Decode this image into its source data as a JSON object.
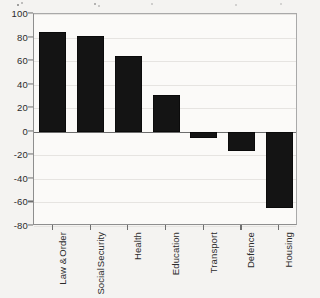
{
  "chart_data": {
    "type": "bar",
    "title": "",
    "subtitle": "",
    "xlabel": "",
    "ylabel": "",
    "categories": [
      "Law & Order",
      "Social Security",
      "Health",
      "Education",
      "Transport",
      "Defence",
      "Housing"
    ],
    "category_lines": [
      [
        "Law &",
        "Order"
      ],
      [
        "Social",
        "Security"
      ],
      [
        "Health"
      ],
      [
        "Education"
      ],
      [
        "Transport"
      ],
      [
        "Defence"
      ],
      [
        "Housing"
      ]
    ],
    "values": [
      85,
      81,
      64,
      31,
      -5,
      -16,
      -65
    ],
    "ylim": [
      -80,
      100
    ],
    "ytick_labels": [
      "100",
      "80",
      "60",
      "40",
      "20",
      "0",
      "-20",
      "-40",
      "-60",
      "-80"
    ],
    "ytick_values": [
      100,
      80,
      60,
      40,
      20,
      0,
      -20,
      -40,
      -60,
      -80
    ],
    "grid": true,
    "legend": false,
    "legend_position": "none",
    "bar_color": "#141414",
    "axis_color": "#6f6f6f",
    "grid_color": "#e6e4e1",
    "background_color": "#f4f3f1",
    "plot_background_color": "#fbfaf8"
  }
}
